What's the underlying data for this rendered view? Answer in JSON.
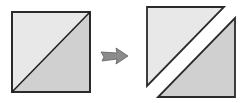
{
  "diagram": {
    "colors": {
      "background": "#ffffff",
      "light_fill": "#e6e6e6",
      "dark_fill": "#cfcfcf",
      "stroke": "#1f1f1f",
      "arrow_fill": "#8a8a8a",
      "arrow_stroke": "#5a5a5a"
    },
    "left_square": {
      "label": "square-with-diagonal",
      "x": 12,
      "y": 12,
      "size": 79
    },
    "arrow": {
      "label": "right-arrow"
    },
    "right_pieces": [
      {
        "label": "upper-left-triangle"
      },
      {
        "label": "lower-right-triangle"
      }
    ]
  }
}
